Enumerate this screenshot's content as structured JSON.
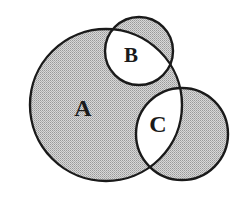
{
  "diagram": {
    "type": "venn",
    "shading_rule": "symmetric-difference (even-odd)",
    "colors": {
      "background": "#ffffff",
      "shade": "#c4c4c4",
      "stroke": "#1a1a1a",
      "text": "#1a1a1a"
    },
    "sets": [
      {
        "id": "A",
        "label": "A",
        "cx": 106,
        "cy": 105,
        "r": 76,
        "label_x": 83,
        "label_y": 116,
        "font_size": 24
      },
      {
        "id": "B",
        "label": "B",
        "cx": 139,
        "cy": 51,
        "r": 34,
        "label_x": 131,
        "label_y": 62,
        "font_size": 21
      },
      {
        "id": "C",
        "label": "C",
        "cx": 182,
        "cy": 134,
        "r": 46,
        "label_x": 158,
        "label_y": 132,
        "font_size": 24
      }
    ],
    "regions": {
      "A_only": "shaded",
      "B_only": "shaded",
      "C_only": "shaded",
      "A_and_B": "unshaded",
      "A_and_C": "unshaded"
    }
  }
}
